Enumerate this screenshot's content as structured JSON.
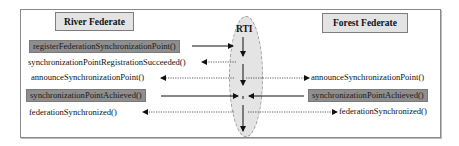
{
  "diagram": {
    "lanes": {
      "left": "River Federate",
      "center": "RTI",
      "right": "Forest Federate"
    },
    "left_calls": [
      {
        "label": "registerFederationSynchronizationPoint()",
        "highlighted": true,
        "direction": "to-rti",
        "style": "solid"
      },
      {
        "label": "synchronizationPointRegistrationSucceeded()",
        "highlighted": false,
        "direction": "from-rti",
        "style": "dotted"
      },
      {
        "label": "announceSynchronizationPoint()",
        "highlighted": false,
        "direction": "from-rti",
        "style": "dotted"
      },
      {
        "label": "synchronizationPointAchieved()",
        "highlighted": true,
        "direction": "to-rti",
        "style": "solid"
      },
      {
        "label": "federationSynchronized()",
        "highlighted": false,
        "direction": "from-rti",
        "style": "dotted"
      }
    ],
    "right_calls": [
      {
        "label": "announceSynchronizationPoint()",
        "highlighted": false,
        "direction": "from-rti",
        "style": "dotted"
      },
      {
        "label": "synchronizationPointAchieved()",
        "highlighted": true,
        "direction": "to-rti",
        "style": "solid"
      },
      {
        "label": "federationSynchronized()",
        "highlighted": false,
        "direction": "from-rti",
        "style": "dotted"
      }
    ],
    "colors": {
      "highlight_fill": "#8e8e8e",
      "box_fill": "#e3e3e3",
      "ellipse_fill": "#e4e4e4",
      "border": "#7d7d7d"
    }
  }
}
